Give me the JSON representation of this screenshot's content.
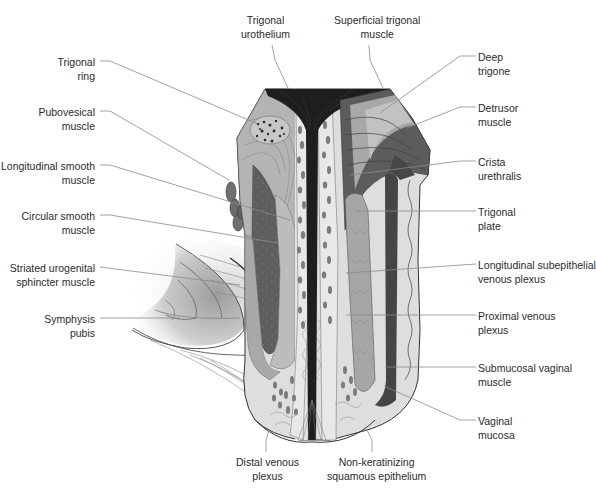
{
  "figure": {
    "type": "anatomical cross-section diagram",
    "caption_cropped": "(partially visible, cut off at bottom edge)"
  },
  "labels": {
    "top": [
      {
        "id": "trigonal-urothelium",
        "lines": [
          "Trigonal",
          "urothelium"
        ]
      },
      {
        "id": "superficial-trigonal-muscle",
        "lines": [
          "Superficial trigonal",
          "muscle"
        ]
      }
    ],
    "left": [
      {
        "id": "trigonal-ring",
        "lines": [
          "Trigonal",
          "ring"
        ]
      },
      {
        "id": "pubovesical-muscle",
        "lines": [
          "Pubovesical",
          "muscle"
        ]
      },
      {
        "id": "longitudinal-smooth-muscle",
        "lines": [
          "Longitudinal smooth",
          "muscle"
        ]
      },
      {
        "id": "circular-smooth-muscle",
        "lines": [
          "Circular smooth",
          "muscle"
        ]
      },
      {
        "id": "striated-urogenital-sphincter",
        "lines": [
          "Striated urogenital",
          "sphincter muscle"
        ]
      },
      {
        "id": "symphysis-pubis",
        "lines": [
          "Symphysis",
          "pubis"
        ]
      }
    ],
    "right": [
      {
        "id": "deep-trigone",
        "lines": [
          "Deep",
          "trigone"
        ]
      },
      {
        "id": "detrusor-muscle",
        "lines": [
          "Detrusor",
          "muscle"
        ]
      },
      {
        "id": "crista-urethralis",
        "lines": [
          "Crista",
          "urethralis"
        ]
      },
      {
        "id": "trigonal-plate",
        "lines": [
          "Trigonal",
          "plate"
        ]
      },
      {
        "id": "longitudinal-subepithelial-venous-plexus",
        "lines": [
          "Longitudinal subepithelial",
          "venous plexus"
        ]
      },
      {
        "id": "proximal-venous-plexus",
        "lines": [
          "Proximal venous",
          "plexus"
        ]
      },
      {
        "id": "submucosal-vaginal-muscle",
        "lines": [
          "Submucosal vaginal",
          "muscle"
        ]
      },
      {
        "id": "vaginal-mucosa",
        "lines": [
          "Vaginal",
          "mucosa"
        ]
      }
    ],
    "bottom": [
      {
        "id": "distal-venous-plexus",
        "lines": [
          "Distal venous",
          "plexus"
        ]
      },
      {
        "id": "non-keratinizing-squamous-epithelium",
        "lines": [
          "Non-keratinizing",
          "squamous epithelium"
        ]
      }
    ]
  },
  "colors": {
    "background": "#ffffff",
    "text": "#2b2b2b",
    "leader": "#8a8a8a",
    "lumen_dark": "#1e1e1e",
    "muscle_dark": "#555555",
    "muscle_mid": "#9a9a9a",
    "muscle_light": "#b8b8b8",
    "submucosa": "#dcdcdc",
    "vein": "#7a7a7a"
  }
}
